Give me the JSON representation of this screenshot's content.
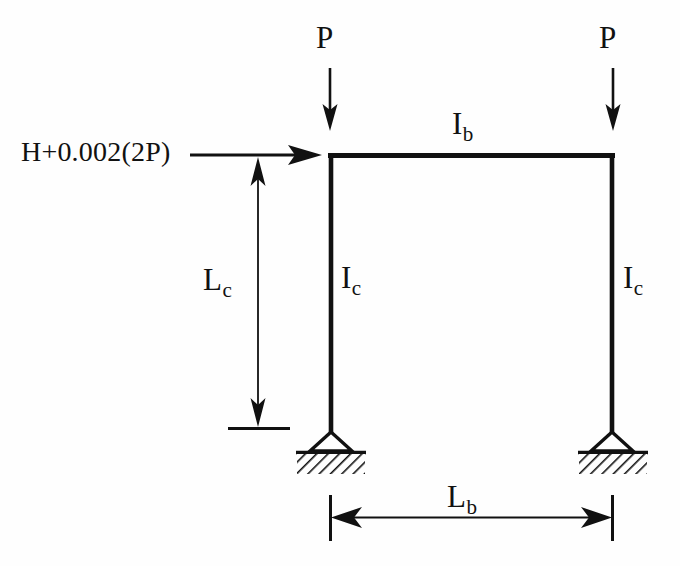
{
  "figure": {
    "type": "structural-frame-diagram",
    "stroke_color": "#111111",
    "background_color": "#fefefe"
  },
  "labels": {
    "load_left": {
      "symbol": "P",
      "subscript": ""
    },
    "load_right": {
      "symbol": "P",
      "subscript": ""
    },
    "beam_inertia": {
      "symbol": "I",
      "subscript": "b"
    },
    "column_inertia_left": {
      "symbol": "I",
      "subscript": "c"
    },
    "column_inertia_right": {
      "symbol": "I",
      "subscript": "c"
    },
    "column_length": {
      "symbol": "L",
      "subscript": "c"
    },
    "beam_span": {
      "symbol": "L",
      "subscript": "b"
    },
    "lateral_load": {
      "text": "H+0.002(2P)"
    }
  },
  "geometry": {
    "frame": {
      "top_left": [
        330,
        153
      ],
      "top_right": [
        613,
        153
      ],
      "base_left": [
        330,
        432
      ],
      "base_right": [
        613,
        432
      ],
      "member_width": 5
    },
    "supports": [
      {
        "name": "pin-support-left",
        "x": 330,
        "apex_y": 432,
        "base_y": 451
      },
      {
        "name": "pin-support-right",
        "x": 613,
        "apex_y": 432,
        "base_y": 451
      }
    ],
    "gravity_arrows": [
      {
        "name": "load-arrow-left",
        "x": 330,
        "y_start": 68,
        "y_end": 128
      },
      {
        "name": "load-arrow-right",
        "x": 613,
        "y_start": 68,
        "y_end": 128
      }
    ],
    "lateral_arrow": {
      "x_start": 190,
      "x_end": 322,
      "y": 155
    },
    "height_dimension": {
      "x": 258,
      "y_top": 160,
      "y_bottom": 428
    },
    "span_dimension": {
      "y": 517,
      "x_left": 330,
      "x_right": 613
    }
  }
}
